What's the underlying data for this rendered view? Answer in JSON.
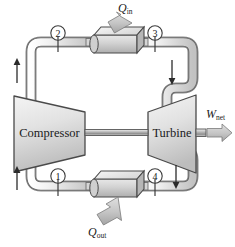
{
  "diagram": {
    "type": "thermodynamic-cycle-schematic",
    "components": {
      "compressor": {
        "label": "Compressor",
        "shape": "trapezoid-left-wide",
        "position": "left-center"
      },
      "turbine": {
        "label": "Turbine",
        "shape": "trapezoid-right-wide",
        "position": "right-center"
      },
      "heat_exchanger_top": {
        "label": "",
        "shape": "3d-box",
        "position": "top-center",
        "role": "heat-addition"
      },
      "heat_exchanger_bottom": {
        "label": "",
        "shape": "3d-box",
        "position": "bottom-center",
        "role": "heat-rejection"
      },
      "shaft": {
        "label": "",
        "position": "between-compressor-and-turbine"
      }
    },
    "state_nodes": [
      {
        "id": "n2",
        "label": "2",
        "x": 58,
        "y": 33,
        "tick_x": 58,
        "tick_y0": 43,
        "tick_y1": 53
      },
      {
        "id": "n3",
        "label": "3",
        "x": 155,
        "y": 33,
        "tick_x": 155,
        "tick_y0": 43,
        "tick_y1": 53
      },
      {
        "id": "n1",
        "label": "1",
        "x": 58,
        "y": 176,
        "tick_x": 58,
        "tick_y0": 186,
        "tick_y1": 196
      },
      {
        "id": "n4",
        "label": "4",
        "x": 155,
        "y": 176,
        "tick_x": 155,
        "tick_y0": 186,
        "tick_y1": 196
      }
    ],
    "energy_flows": [
      {
        "id": "q-in",
        "symbol": "Q",
        "subscript": "in",
        "label": "Qin",
        "direction": "into-top-heat-exchanger",
        "arrow": "down-left-diagonal"
      },
      {
        "id": "q-out",
        "symbol": "Q",
        "subscript": "out",
        "label": "Qout",
        "direction": "out-of-bottom-heat-exchanger",
        "arrow": "down-left-diagonal"
      },
      {
        "id": "w-net",
        "symbol": "W",
        "subscript": "net",
        "label": "Wnet",
        "direction": "out-of-turbine",
        "arrow": "right-horizontal"
      }
    ],
    "flow_arrows": [
      {
        "id": "flow-left-upper",
        "direction": "up",
        "x": 22,
        "y": 72
      },
      {
        "id": "flow-right-upper",
        "direction": "down",
        "x": 172,
        "y": 72
      },
      {
        "id": "flow-left-lower",
        "direction": "up",
        "x": 22,
        "y": 178
      },
      {
        "id": "flow-right-lower",
        "direction": "down",
        "x": 172,
        "y": 178
      }
    ],
    "colors": {
      "outline": "#3b3b3b",
      "pipe_fill": "#e3e3e3",
      "pipe_edge": "#9a9a9a",
      "body_fill_light": "#e9e9e9",
      "body_fill_mid": "#cfcfcf",
      "body_fill_dark": "#b4b4b4",
      "arrow_fill": "#c9c9c9",
      "text": "#1b1b1b",
      "background": "#ffffff"
    }
  }
}
